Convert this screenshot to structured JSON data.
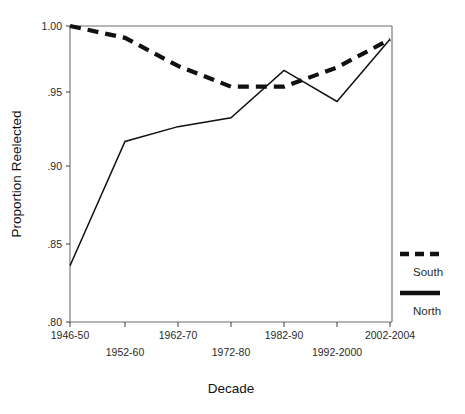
{
  "chart_data": {
    "type": "line",
    "title": "",
    "xlabel": "Decade",
    "ylabel": "Proportion Reelected",
    "categories": [
      "1946-50",
      "1952-60",
      "1962-70",
      "1972-80",
      "1982-90",
      "1992-2000",
      "2002-2004"
    ],
    "xtick_labels_upper": [
      "1946-50",
      "1962-70",
      "1982-90",
      "2002-2004"
    ],
    "xtick_labels_lower": [
      "1952-60",
      "1972-80",
      "1992-2000"
    ],
    "ylim": [
      0.8,
      1.0
    ],
    "ytick_labels": [
      "1.00",
      ".95",
      ".90",
      ".85",
      ".80"
    ],
    "ytick_values": [
      1.0,
      0.95,
      0.9,
      0.85,
      0.8
    ],
    "grid": false,
    "legend_position": "right",
    "series": [
      {
        "name": "South",
        "style": "dashed",
        "color": "#111111",
        "values": [
          1.0,
          0.992,
          0.973,
          0.959,
          0.959,
          0.972,
          0.991
        ]
      },
      {
        "name": "North",
        "style": "solid",
        "color": "#111111",
        "values": [
          0.838,
          0.922,
          0.932,
          0.938,
          0.97,
          0.949,
          0.991
        ]
      }
    ]
  },
  "legend": {
    "south_label": "South",
    "north_label": "North"
  },
  "axes": {
    "y_title": "Proportion Reelected",
    "x_title": "Decade",
    "y_tick_0": "1.00",
    "y_tick_1": ".95",
    "y_tick_2": ".90",
    "y_tick_3": ".85",
    "y_tick_4": ".80",
    "x_tick_0": "1946-50",
    "x_tick_1": "1952-60",
    "x_tick_2": "1962-70",
    "x_tick_3": "1972-80",
    "x_tick_4": "1982-90",
    "x_tick_5": "1992-2000",
    "x_tick_6": "2002-2004"
  }
}
